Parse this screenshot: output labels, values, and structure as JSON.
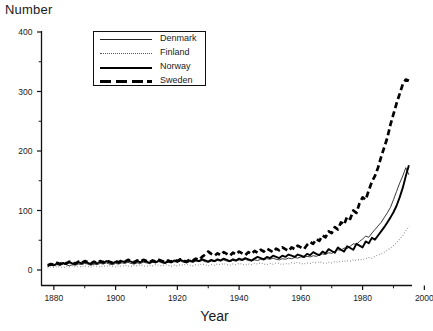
{
  "axis_title_y": "Number",
  "axis_title_x": "Year",
  "legend": {
    "entries": [
      {
        "label": "Denmark",
        "style": "thin-solid",
        "key": "denmark"
      },
      {
        "label": "Finland",
        "style": "dotted",
        "key": "finland"
      },
      {
        "label": "Norway",
        "style": "thick-solid",
        "key": "norway"
      },
      {
        "label": "Sweden",
        "style": "thick-dashed",
        "key": "sweden"
      }
    ]
  },
  "chart_data": {
    "type": "line",
    "title": "",
    "xlabel": "Year",
    "ylabel": "Number",
    "xlim": [
      1876,
      1996
    ],
    "ylim": [
      0,
      400
    ],
    "yticks": [
      0,
      100,
      200,
      300,
      400
    ],
    "yticks_minor": [
      50,
      150,
      250,
      350
    ],
    "xticks": [
      1880,
      1900,
      1920,
      1940,
      1960,
      1980,
      2000
    ],
    "xticks_minor": [
      1890,
      1910,
      1930,
      1950,
      1970,
      1990
    ],
    "grid": false,
    "legend_position": "top-left-inside",
    "x": [
      1878,
      1879,
      1880,
      1881,
      1882,
      1883,
      1884,
      1885,
      1886,
      1887,
      1888,
      1889,
      1890,
      1891,
      1892,
      1893,
      1894,
      1895,
      1896,
      1897,
      1898,
      1899,
      1900,
      1901,
      1902,
      1903,
      1904,
      1905,
      1906,
      1907,
      1908,
      1909,
      1910,
      1911,
      1912,
      1913,
      1914,
      1915,
      1916,
      1917,
      1918,
      1919,
      1920,
      1921,
      1922,
      1923,
      1924,
      1925,
      1926,
      1927,
      1928,
      1929,
      1930,
      1931,
      1932,
      1933,
      1934,
      1935,
      1936,
      1937,
      1938,
      1939,
      1940,
      1941,
      1942,
      1943,
      1944,
      1945,
      1946,
      1947,
      1948,
      1949,
      1950,
      1951,
      1952,
      1953,
      1954,
      1955,
      1956,
      1957,
      1958,
      1959,
      1960,
      1961,
      1962,
      1963,
      1964,
      1965,
      1966,
      1967,
      1968,
      1969,
      1970,
      1971,
      1972,
      1973,
      1974,
      1975,
      1976,
      1977,
      1978,
      1979,
      1980,
      1981,
      1982,
      1983,
      1984,
      1985,
      1986,
      1987,
      1988,
      1989,
      1990,
      1991,
      1992,
      1993,
      1994,
      1995
    ],
    "series": [
      {
        "name": "Denmark",
        "style": "thin-solid",
        "values": [
          6,
          8,
          7,
          9,
          8,
          10,
          9,
          7,
          9,
          8,
          10,
          9,
          11,
          10,
          8,
          10,
          9,
          11,
          10,
          12,
          10,
          9,
          11,
          10,
          12,
          11,
          13,
          11,
          10,
          12,
          11,
          13,
          12,
          11,
          13,
          12,
          14,
          12,
          11,
          13,
          12,
          14,
          13,
          15,
          13,
          12,
          14,
          13,
          15,
          14,
          16,
          14,
          13,
          15,
          14,
          16,
          15,
          17,
          15,
          14,
          16,
          15,
          17,
          16,
          18,
          16,
          15,
          17,
          16,
          18,
          17,
          19,
          18,
          20,
          18,
          17,
          19,
          18,
          20,
          19,
          21,
          20,
          22,
          21,
          23,
          22,
          24,
          23,
          25,
          27,
          26,
          29,
          28,
          31,
          34,
          33,
          37,
          36,
          40,
          44,
          43,
          48,
          52,
          57,
          55,
          62,
          68,
          74,
          80,
          88,
          96,
          105,
          118,
          132,
          146,
          158,
          172,
          160
        ]
      },
      {
        "name": "Finland",
        "style": "dotted",
        "values": [
          4,
          5,
          4,
          6,
          5,
          4,
          6,
          5,
          7,
          5,
          6,
          5,
          7,
          6,
          5,
          7,
          6,
          5,
          7,
          6,
          8,
          6,
          5,
          7,
          6,
          8,
          7,
          6,
          8,
          7,
          9,
          7,
          6,
          8,
          7,
          9,
          8,
          7,
          9,
          8,
          6,
          8,
          7,
          9,
          8,
          10,
          8,
          7,
          9,
          8,
          10,
          9,
          7,
          9,
          8,
          10,
          9,
          11,
          9,
          8,
          10,
          9,
          11,
          10,
          8,
          10,
          9,
          11,
          10,
          12,
          10,
          9,
          11,
          10,
          12,
          11,
          9,
          11,
          10,
          12,
          11,
          13,
          11,
          10,
          12,
          11,
          13,
          12,
          14,
          12,
          11,
          13,
          12,
          14,
          13,
          15,
          14,
          16,
          15,
          17,
          16,
          18,
          17,
          19,
          21,
          20,
          23,
          25,
          27,
          30,
          33,
          37,
          41,
          46,
          52,
          58,
          66,
          74
        ]
      },
      {
        "name": "Norway",
        "style": "thick-solid",
        "values": [
          7,
          9,
          8,
          11,
          9,
          12,
          10,
          13,
          11,
          10,
          13,
          11,
          14,
          12,
          10,
          13,
          11,
          14,
          12,
          15,
          13,
          11,
          14,
          12,
          15,
          13,
          16,
          14,
          12,
          15,
          13,
          16,
          14,
          12,
          15,
          13,
          16,
          14,
          12,
          15,
          13,
          16,
          14,
          17,
          15,
          13,
          16,
          14,
          17,
          15,
          18,
          16,
          14,
          17,
          15,
          18,
          16,
          19,
          17,
          15,
          18,
          16,
          19,
          17,
          20,
          18,
          16,
          19,
          22,
          20,
          18,
          22,
          20,
          24,
          22,
          20,
          24,
          22,
          26,
          24,
          22,
          26,
          24,
          22,
          27,
          25,
          30,
          27,
          25,
          31,
          28,
          35,
          32,
          29,
          38,
          34,
          31,
          40,
          37,
          34,
          44,
          41,
          38,
          48,
          45,
          54,
          51,
          58,
          65,
          72,
          80,
          88,
          97,
          108,
          122,
          138,
          158,
          176
        ]
      },
      {
        "name": "Sweden",
        "style": "thick-dashed",
        "values": [
          8,
          10,
          9,
          12,
          10,
          13,
          11,
          14,
          12,
          11,
          14,
          12,
          15,
          13,
          11,
          14,
          12,
          15,
          13,
          16,
          14,
          12,
          15,
          13,
          16,
          14,
          17,
          15,
          13,
          16,
          14,
          17,
          15,
          13,
          16,
          14,
          17,
          15,
          13,
          16,
          14,
          17,
          15,
          18,
          16,
          14,
          18,
          16,
          19,
          17,
          22,
          26,
          31,
          27,
          24,
          28,
          25,
          30,
          27,
          24,
          29,
          26,
          31,
          28,
          25,
          30,
          27,
          32,
          29,
          34,
          31,
          36,
          33,
          30,
          36,
          33,
          38,
          35,
          32,
          38,
          35,
          41,
          38,
          35,
          42,
          47,
          44,
          52,
          49,
          58,
          55,
          65,
          62,
          72,
          68,
          80,
          76,
          90,
          86,
          100,
          96,
          112,
          122,
          118,
          134,
          148,
          158,
          172,
          190,
          206,
          222,
          244,
          262,
          280,
          296,
          312,
          320,
          318
        ]
      }
    ]
  }
}
